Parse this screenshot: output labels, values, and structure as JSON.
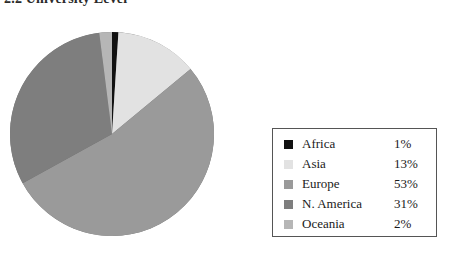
{
  "title": {
    "text": "2.2  University Level"
  },
  "legend": {
    "border_color": "#555555",
    "rows": [
      {
        "label": "Africa",
        "value": "1%",
        "color": "#111111"
      },
      {
        "label": "Asia",
        "value": "13%",
        "color": "#e2e2e2"
      },
      {
        "label": "Europe",
        "value": "53%",
        "color": "#9a9a9a"
      },
      {
        "label": "N. America",
        "value": "31%",
        "color": "#7e7e7e"
      },
      {
        "label": "Oceania",
        "value": "2%",
        "color": "#b6b6b6"
      }
    ]
  },
  "chart_data": {
    "type": "pie",
    "title": "2.2  University Level",
    "xlabel": "",
    "ylabel": "",
    "legend_position": "right",
    "grid": false,
    "categories": [
      "Africa",
      "Asia",
      "Europe",
      "N. America",
      "Oceania"
    ],
    "values": [
      1,
      13,
      53,
      31,
      2
    ],
    "units": "%",
    "colors": [
      "#111111",
      "#e2e2e2",
      "#9a9a9a",
      "#7e7e7e",
      "#b6b6b6"
    ],
    "slices": [
      {
        "label": "Africa",
        "value": 1,
        "display": "1%",
        "color": "#111111"
      },
      {
        "label": "Asia",
        "value": 13,
        "display": "13%",
        "color": "#e2e2e2"
      },
      {
        "label": "Europe",
        "value": 53,
        "display": "53%",
        "color": "#9a9a9a"
      },
      {
        "label": "N. America",
        "value": 31,
        "display": "31%",
        "color": "#7e7e7e"
      },
      {
        "label": "Oceania",
        "value": 2,
        "display": "2%",
        "color": "#b6b6b6"
      }
    ],
    "start_angle_deg": -90,
    "direction": "clockwise",
    "has_3d_shading": true
  },
  "pie_style": {
    "shadow_color": "#6b6b6b",
    "edge_color": "#5f5f5f"
  }
}
